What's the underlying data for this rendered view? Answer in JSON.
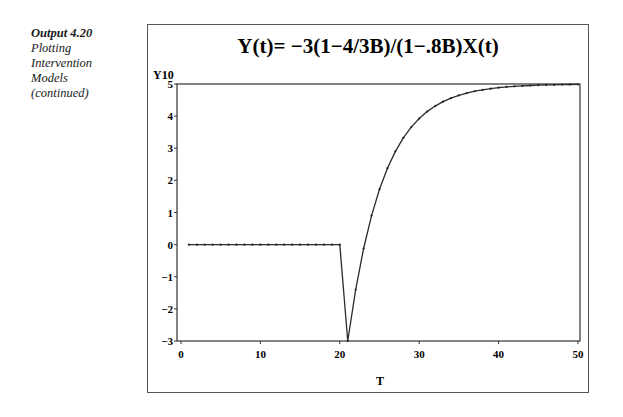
{
  "caption": {
    "number": "Output 4.20",
    "lines": [
      "Plotting",
      "Intervention",
      "Models",
      "(continued)"
    ]
  },
  "chart_data": {
    "type": "line",
    "title": "Y(t)= −3(1−4/3B)/(1−.8B)X(t)",
    "xlabel": "T",
    "ylabel": "Y10",
    "xlim": [
      0,
      50
    ],
    "ylim": [
      -3,
      5
    ],
    "xticks": [
      0,
      10,
      20,
      30,
      40,
      50
    ],
    "yticks": [
      5,
      4,
      3,
      2,
      1,
      0,
      -1,
      -2,
      -3
    ],
    "ytick_labels": [
      "5",
      "4",
      "3",
      "2",
      "1",
      "0",
      "−1",
      "−2",
      "−3"
    ],
    "grid": false,
    "legend": null,
    "marker": "dot",
    "x": [
      1,
      2,
      3,
      4,
      5,
      6,
      7,
      8,
      9,
      10,
      11,
      12,
      13,
      14,
      15,
      16,
      17,
      18,
      19,
      20,
      21,
      22,
      23,
      24,
      25,
      26,
      27,
      28,
      29,
      30,
      31,
      32,
      33,
      34,
      35,
      36,
      37,
      38,
      39,
      40,
      41,
      42,
      43,
      44,
      45,
      46,
      47,
      48,
      49,
      50
    ],
    "series": [
      {
        "name": "Y10",
        "values": [
          0,
          0,
          0,
          0,
          0,
          0,
          0,
          0,
          0,
          0,
          0,
          0,
          0,
          0,
          0,
          0,
          0,
          0,
          0,
          0,
          -3,
          -1.4,
          -0.12,
          0.904,
          1.7232,
          2.3786,
          2.9028,
          3.3223,
          3.6578,
          3.9263,
          4.141,
          4.3128,
          4.4502,
          4.5602,
          4.6482,
          4.7185,
          4.7748,
          4.8199,
          4.8559,
          4.8847,
          4.9078,
          4.9262,
          4.941,
          4.9528,
          4.9622,
          4.9698,
          4.9758,
          4.9807,
          4.9845,
          4.9876
        ]
      }
    ]
  },
  "colors": {
    "line": "#2a2a2a",
    "frame": "#555555",
    "text": "#1a1a1a"
  }
}
